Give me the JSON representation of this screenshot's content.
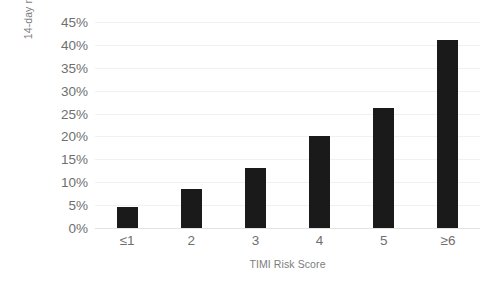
{
  "chart_data": {
    "type": "bar",
    "title": "",
    "subtitle": "",
    "xlabel": "TIMI Risk Score",
    "ylabel": "14-day risk",
    "categories": [
      "≤1",
      "2",
      "3",
      "4",
      "5",
      "≥6"
    ],
    "values": [
      4.7,
      8.5,
      13.2,
      20.2,
      26.3,
      41.0
    ],
    "series": [
      {
        "name": "14-day risk",
        "values": [
          4.7,
          8.5,
          13.2,
          20.2,
          26.3,
          41.0
        ]
      }
    ],
    "ylim": [
      0,
      45
    ],
    "ytick_values": [
      0,
      5,
      10,
      15,
      20,
      25,
      30,
      35,
      40,
      45
    ],
    "ytick_labels": [
      "0%",
      "5%",
      "10%",
      "15%",
      "20%",
      "25%",
      "30%",
      "35%",
      "40%",
      "45%"
    ],
    "grid": true,
    "grid_axis": "y",
    "legend": false,
    "legend_position": "none",
    "annotations": [],
    "colors": {
      "bar": "#1a1a1a",
      "gridline": "#f1f1f1",
      "baseline": "#e3e3e3",
      "tick_text": "#6f6f6f",
      "axis_title_text": "#7d7d7d",
      "background": "#ffffff"
    }
  }
}
